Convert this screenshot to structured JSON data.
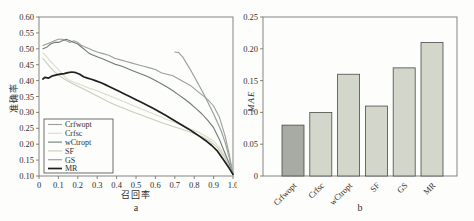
{
  "figure": {
    "captions": {
      "left": "a",
      "right": "b"
    }
  },
  "chart_data": [
    {
      "type": "line",
      "panel": "a",
      "xlabel": "召回率",
      "ylabel": "准确率",
      "xlim": [
        0,
        1.0
      ],
      "ylim": [
        0.1,
        0.6
      ],
      "grid": false,
      "legend_position": "bottom-left",
      "axis_color": "#787878",
      "x_tick_values": [
        0,
        0.1,
        0.2,
        0.3,
        0.4,
        0.5,
        0.6,
        0.7,
        0.8,
        0.9,
        1.0
      ],
      "x_tick_labels": [
        "0",
        "0.1",
        "0.2",
        "0.3",
        "0.4",
        "0.5",
        "0.6",
        "0.7",
        "0.8",
        "0.9",
        "1.0"
      ],
      "y_tick_values": [
        0.1,
        0.15,
        0.2,
        0.25,
        0.3,
        0.35,
        0.4,
        0.45,
        0.5,
        0.55,
        0.6
      ],
      "y_tick_labels": [
        "0.10",
        "0.15",
        "0.20",
        "0.25",
        "0.30",
        "0.35",
        "0.40",
        "0.45",
        "0.50",
        "0.55",
        "0.60"
      ],
      "series": [
        {
          "name": "Crfwopt",
          "color": "#99a199",
          "width": 1.1,
          "points": [
            [
              0.02,
              0.51
            ],
            [
              0.04,
              0.515
            ],
            [
              0.06,
              0.52
            ],
            [
              0.08,
              0.525
            ],
            [
              0.1,
              0.53
            ],
            [
              0.12,
              0.53
            ],
            [
              0.14,
              0.525
            ],
            [
              0.16,
              0.52
            ],
            [
              0.18,
              0.525
            ],
            [
              0.2,
              0.52
            ],
            [
              0.22,
              0.51
            ],
            [
              0.24,
              0.505
            ],
            [
              0.26,
              0.5
            ],
            [
              0.28,
              0.495
            ],
            [
              0.3,
              0.49
            ],
            [
              0.33,
              0.485
            ],
            [
              0.36,
              0.48
            ],
            [
              0.39,
              0.47
            ],
            [
              0.42,
              0.465
            ],
            [
              0.45,
              0.46
            ],
            [
              0.48,
              0.455
            ],
            [
              0.51,
              0.45
            ],
            [
              0.54,
              0.445
            ],
            [
              0.57,
              0.44
            ],
            [
              0.6,
              0.435
            ],
            [
              0.63,
              0.425
            ],
            [
              0.66,
              0.42
            ],
            [
              0.69,
              0.415
            ],
            [
              0.72,
              0.405
            ],
            [
              0.75,
              0.395
            ],
            [
              0.78,
              0.385
            ],
            [
              0.81,
              0.37
            ],
            [
              0.84,
              0.355
            ],
            [
              0.87,
              0.34
            ],
            [
              0.9,
              0.32
            ],
            [
              0.93,
              0.285
            ],
            [
              0.96,
              0.225
            ],
            [
              0.98,
              0.17
            ],
            [
              1.0,
              0.105
            ]
          ]
        },
        {
          "name": "Crfsc",
          "color": "#dcdcc8",
          "width": 1.1,
          "points": [
            [
              0.02,
              0.488
            ],
            [
              0.04,
              0.475
            ],
            [
              0.06,
              0.46
            ],
            [
              0.08,
              0.448
            ],
            [
              0.1,
              0.435
            ],
            [
              0.12,
              0.42
            ],
            [
              0.14,
              0.408
            ],
            [
              0.16,
              0.4
            ],
            [
              0.18,
              0.395
            ],
            [
              0.2,
              0.39
            ],
            [
              0.23,
              0.383
            ],
            [
              0.26,
              0.376
            ],
            [
              0.3,
              0.368
            ],
            [
              0.34,
              0.358
            ],
            [
              0.38,
              0.348
            ],
            [
              0.42,
              0.338
            ],
            [
              0.46,
              0.328
            ],
            [
              0.5,
              0.318
            ],
            [
              0.54,
              0.308
            ],
            [
              0.58,
              0.298
            ],
            [
              0.62,
              0.288
            ],
            [
              0.66,
              0.278
            ],
            [
              0.7,
              0.268
            ],
            [
              0.74,
              0.258
            ],
            [
              0.78,
              0.248
            ],
            [
              0.82,
              0.238
            ],
            [
              0.86,
              0.225
            ],
            [
              0.9,
              0.21
            ],
            [
              0.93,
              0.19
            ],
            [
              0.96,
              0.16
            ],
            [
              1.0,
              0.105
            ]
          ]
        },
        {
          "name": "wCtropt",
          "color": "#6e7c72",
          "width": 1.1,
          "points": [
            [
              0.02,
              0.5
            ],
            [
              0.04,
              0.505
            ],
            [
              0.06,
              0.515
            ],
            [
              0.08,
              0.52
            ],
            [
              0.1,
              0.52
            ],
            [
              0.12,
              0.525
            ],
            [
              0.14,
              0.53
            ],
            [
              0.16,
              0.525
            ],
            [
              0.18,
              0.52
            ],
            [
              0.2,
              0.515
            ],
            [
              0.22,
              0.505
            ],
            [
              0.24,
              0.495
            ],
            [
              0.26,
              0.485
            ],
            [
              0.28,
              0.48
            ],
            [
              0.3,
              0.475
            ],
            [
              0.33,
              0.468
            ],
            [
              0.36,
              0.46
            ],
            [
              0.39,
              0.452
            ],
            [
              0.42,
              0.447
            ],
            [
              0.45,
              0.44
            ],
            [
              0.48,
              0.432
            ],
            [
              0.51,
              0.425
            ],
            [
              0.54,
              0.418
            ],
            [
              0.57,
              0.41
            ],
            [
              0.6,
              0.4
            ],
            [
              0.63,
              0.39
            ],
            [
              0.66,
              0.38
            ],
            [
              0.69,
              0.368
            ],
            [
              0.72,
              0.355
            ],
            [
              0.75,
              0.342
            ],
            [
              0.78,
              0.328
            ],
            [
              0.81,
              0.312
            ],
            [
              0.84,
              0.295
            ],
            [
              0.87,
              0.275
            ],
            [
              0.9,
              0.252
            ],
            [
              0.93,
              0.215
            ],
            [
              0.96,
              0.17
            ],
            [
              0.98,
              0.14
            ],
            [
              1.0,
              0.105
            ]
          ]
        },
        {
          "name": "SF",
          "color": "#c8cebc",
          "width": 1.1,
          "points": [
            [
              0.02,
              0.47
            ],
            [
              0.04,
              0.455
            ],
            [
              0.06,
              0.44
            ],
            [
              0.08,
              0.428
            ],
            [
              0.1,
              0.418
            ],
            [
              0.13,
              0.405
            ],
            [
              0.16,
              0.395
            ],
            [
              0.2,
              0.382
            ],
            [
              0.24,
              0.37
            ],
            [
              0.28,
              0.358
            ],
            [
              0.32,
              0.345
            ],
            [
              0.36,
              0.333
            ],
            [
              0.4,
              0.322
            ],
            [
              0.44,
              0.312
            ],
            [
              0.48,
              0.302
            ],
            [
              0.52,
              0.293
            ],
            [
              0.56,
              0.284
            ],
            [
              0.6,
              0.275
            ],
            [
              0.64,
              0.266
            ],
            [
              0.68,
              0.258
            ],
            [
              0.72,
              0.25
            ],
            [
              0.76,
              0.242
            ],
            [
              0.8,
              0.234
            ],
            [
              0.84,
              0.224
            ],
            [
              0.88,
              0.21
            ],
            [
              0.92,
              0.19
            ],
            [
              0.96,
              0.155
            ],
            [
              1.0,
              0.105
            ]
          ]
        },
        {
          "name": "GS",
          "color": "#9aa29e",
          "width": 1.2,
          "points": [
            [
              0.7,
              0.49
            ],
            [
              0.72,
              0.488
            ],
            [
              0.74,
              0.475
            ],
            [
              0.76,
              0.455
            ],
            [
              0.78,
              0.435
            ],
            [
              0.8,
              0.413
            ],
            [
              0.82,
              0.39
            ],
            [
              0.84,
              0.368
            ],
            [
              0.86,
              0.345
            ],
            [
              0.88,
              0.32
            ],
            [
              0.9,
              0.295
            ],
            [
              0.92,
              0.268
            ],
            [
              0.94,
              0.24
            ],
            [
              0.96,
              0.205
            ],
            [
              0.98,
              0.16
            ],
            [
              1.0,
              0.105
            ]
          ]
        },
        {
          "name": "MR",
          "color": "#1f1f1f",
          "width": 1.7,
          "points": [
            [
              0.02,
              0.405
            ],
            [
              0.03,
              0.41
            ],
            [
              0.05,
              0.408
            ],
            [
              0.07,
              0.415
            ],
            [
              0.09,
              0.418
            ],
            [
              0.11,
              0.42
            ],
            [
              0.13,
              0.422
            ],
            [
              0.15,
              0.425
            ],
            [
              0.17,
              0.427
            ],
            [
              0.19,
              0.425
            ],
            [
              0.21,
              0.42
            ],
            [
              0.23,
              0.412
            ],
            [
              0.25,
              0.408
            ],
            [
              0.27,
              0.404
            ],
            [
              0.29,
              0.4
            ],
            [
              0.32,
              0.393
            ],
            [
              0.35,
              0.385
            ],
            [
              0.38,
              0.376
            ],
            [
              0.41,
              0.367
            ],
            [
              0.44,
              0.358
            ],
            [
              0.47,
              0.349
            ],
            [
              0.5,
              0.34
            ],
            [
              0.53,
              0.331
            ],
            [
              0.56,
              0.322
            ],
            [
              0.59,
              0.312
            ],
            [
              0.62,
              0.302
            ],
            [
              0.65,
              0.292
            ],
            [
              0.68,
              0.281
            ],
            [
              0.71,
              0.27
            ],
            [
              0.74,
              0.259
            ],
            [
              0.77,
              0.248
            ],
            [
              0.8,
              0.236
            ],
            [
              0.83,
              0.224
            ],
            [
              0.86,
              0.211
            ],
            [
              0.89,
              0.196
            ],
            [
              0.92,
              0.178
            ],
            [
              0.95,
              0.152
            ],
            [
              0.98,
              0.125
            ],
            [
              1.0,
              0.105
            ]
          ]
        }
      ]
    },
    {
      "type": "bar",
      "panel": "b",
      "xlabel": "",
      "ylabel": "MAE",
      "ylim": [
        0,
        0.25
      ],
      "grid": false,
      "axis_color": "#787878",
      "y_tick_values": [
        0,
        0.05,
        0.1,
        0.15,
        0.2,
        0.25
      ],
      "y_tick_labels": [
        "0",
        "0.05",
        "0.10",
        "0.15",
        "0.20",
        "0.25"
      ],
      "categories": [
        "Crfwopt",
        "Crfsc",
        "wCtropt",
        "SF",
        "GS",
        "MR"
      ],
      "values": [
        0.08,
        0.1,
        0.16,
        0.11,
        0.17,
        0.21
      ],
      "bar_colors": [
        "#a7aba3",
        "#d3d7cb",
        "#d3d7cb",
        "#d3d7cb",
        "#d3d7cb",
        "#d3d7cb"
      ],
      "bar_outline": "#4a4a46"
    }
  ]
}
